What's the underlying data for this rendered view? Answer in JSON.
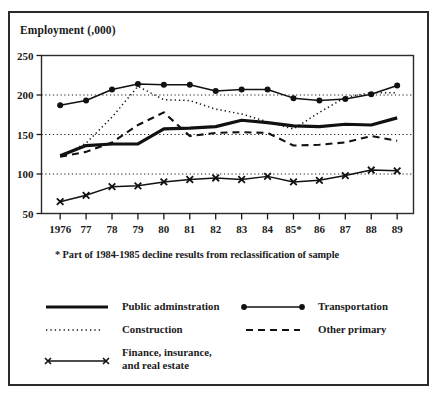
{
  "figure": {
    "axis_title": "Employment (,000)",
    "footnote": "* Part of 1984-1985 decline results from reclassification of sample"
  },
  "chart_data": {
    "type": "line",
    "title": "",
    "xlabel": "",
    "ylabel": "Employment (,000)",
    "ylim": [
      50,
      250
    ],
    "ytick_labels": [
      "50",
      "100",
      "150",
      "200",
      "250"
    ],
    "yticks": [
      50,
      100,
      150,
      200,
      250
    ],
    "grid": "horizontal-dotted-at-100-150-200",
    "legend_position": "below-plot",
    "categories": [
      "1976",
      "77",
      "78",
      "79",
      "80",
      "81",
      "82",
      "83",
      "84",
      "85*",
      "86",
      "87",
      "88",
      "89"
    ],
    "x": [
      1976,
      1977,
      1978,
      1979,
      1980,
      1981,
      1982,
      1983,
      1984,
      1985,
      1986,
      1987,
      1988,
      1989
    ],
    "series": [
      {
        "name": "Public adminstration",
        "style": "solid-thick",
        "marker": "none",
        "color": "#111111",
        "values": [
          123,
          136,
          138,
          138,
          157,
          158,
          160,
          168,
          165,
          161,
          160,
          163,
          162,
          171
        ]
      },
      {
        "name": "Transportation",
        "style": "solid-thin",
        "marker": "circle",
        "color": "#111111",
        "values": [
          187,
          193,
          207,
          214,
          213,
          213,
          205,
          207,
          207,
          196,
          193,
          195,
          201,
          212
        ]
      },
      {
        "name": "Construction",
        "style": "dotted",
        "marker": "none",
        "color": "#111111",
        "values": [
          122,
          139,
          172,
          211,
          194,
          193,
          182,
          176,
          166,
          157,
          178,
          197,
          203,
          203
        ]
      },
      {
        "name": "Other primary",
        "style": "dashed",
        "marker": "none",
        "color": "#111111",
        "values": [
          122,
          128,
          140,
          162,
          178,
          148,
          152,
          153,
          152,
          136,
          137,
          140,
          148,
          142
        ]
      },
      {
        "name": "Finance, insurance, and real estate",
        "style": "solid-thin",
        "marker": "x",
        "color": "#111111",
        "values": [
          65,
          73,
          84,
          85,
          90,
          93,
          95,
          93,
          97,
          90,
          92,
          98,
          105,
          104
        ]
      }
    ]
  },
  "legend": {
    "items": [
      {
        "label": "Public adminstration",
        "style": "solid-thick",
        "marker": "none"
      },
      {
        "label": "Transportation",
        "style": "solid-thin",
        "marker": "circle"
      },
      {
        "label": "Construction",
        "style": "dotted",
        "marker": "none"
      },
      {
        "label": "Other primary",
        "style": "dashed",
        "marker": "none"
      },
      {
        "label": "Finance, insurance,",
        "label2": "and real estate",
        "style": "solid-thin",
        "marker": "x"
      }
    ]
  }
}
